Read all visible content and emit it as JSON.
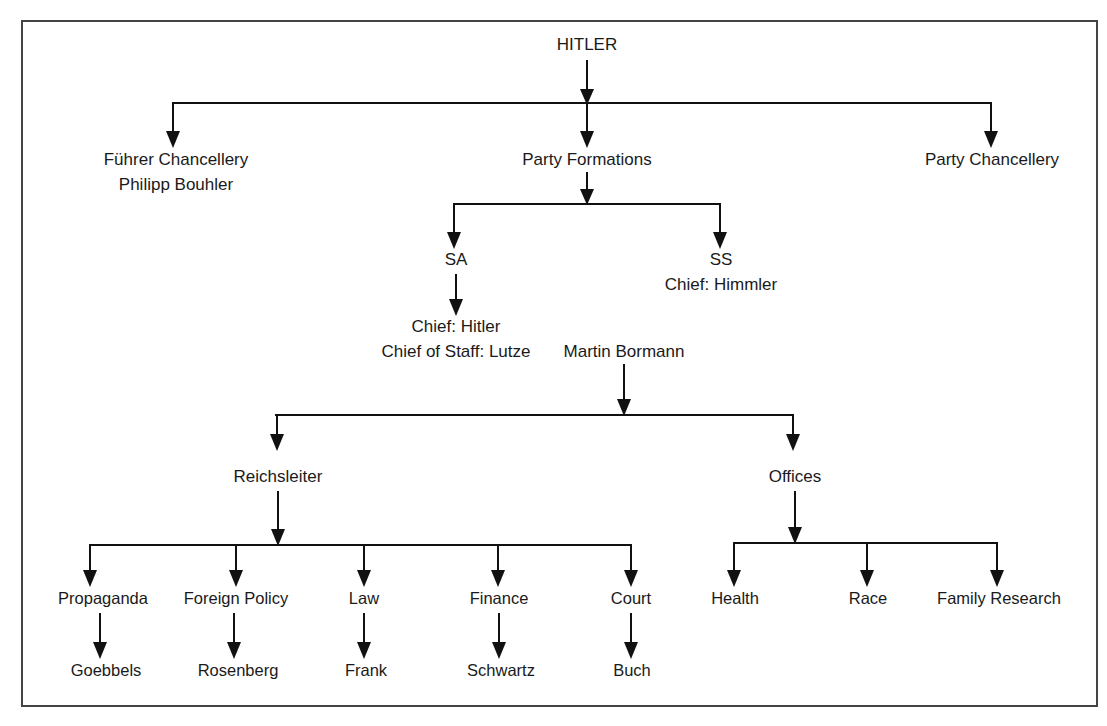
{
  "diagram": {
    "type": "org-chart",
    "frame": {
      "x": 21,
      "y": 20,
      "width": 1077,
      "height": 687,
      "color": "#444444"
    },
    "line_color": "#111111",
    "text_color": "#1a1a1a",
    "background": "#ffffff",
    "nodes": [
      {
        "id": "hitler",
        "label": "HITLER",
        "x": 587,
        "y": 50,
        "level": 0
      },
      {
        "id": "fuhrer-chancellery",
        "label": "Führer Chancellery",
        "x": 176,
        "y": 165,
        "level": 1
      },
      {
        "id": "philipp-bouhler",
        "label": "Philipp Bouhler",
        "x": 176,
        "y": 190,
        "level": 1
      },
      {
        "id": "party-formations",
        "label": "Party Formations",
        "x": 587,
        "y": 165,
        "level": 1
      },
      {
        "id": "party-chancellery",
        "label": "Party Chancellery",
        "x": 992,
        "y": 165,
        "level": 1
      },
      {
        "id": "sa",
        "label": "SA",
        "x": 456,
        "y": 265,
        "level": 2
      },
      {
        "id": "ss",
        "label": "SS",
        "x": 721,
        "y": 265,
        "level": 2
      },
      {
        "id": "ss-chief",
        "label": "Chief: Himmler",
        "x": 721,
        "y": 290,
        "level": 2
      },
      {
        "id": "sa-chief",
        "label": "Chief: Hitler",
        "x": 456,
        "y": 332,
        "level": 3
      },
      {
        "id": "sa-chief-of-staff",
        "label": "Chief of Staff: Lutze",
        "x": 456,
        "y": 357,
        "level": 3
      },
      {
        "id": "martin-bormann",
        "label": "Martin Bormann",
        "x": 624,
        "y": 357,
        "level": 3
      },
      {
        "id": "reichsleiter",
        "label": "Reichsleiter",
        "x": 278,
        "y": 482,
        "level": 4
      },
      {
        "id": "offices",
        "label": "Offices",
        "x": 795,
        "y": 482,
        "level": 4
      },
      {
        "id": "propaganda",
        "label": "Propaganda",
        "x": 103,
        "y": 604,
        "level": 5
      },
      {
        "id": "foreign-policy",
        "label": "Foreign Policy",
        "x": 236,
        "y": 604,
        "level": 5
      },
      {
        "id": "law",
        "label": "Law",
        "x": 364,
        "y": 604,
        "level": 5
      },
      {
        "id": "finance",
        "label": "Finance",
        "x": 499,
        "y": 604,
        "level": 5
      },
      {
        "id": "court",
        "label": "Court",
        "x": 631,
        "y": 604,
        "level": 5
      },
      {
        "id": "health",
        "label": "Health",
        "x": 735,
        "y": 604,
        "level": 5
      },
      {
        "id": "race",
        "label": "Race",
        "x": 868,
        "y": 604,
        "level": 5
      },
      {
        "id": "family-research",
        "label": "Family Research",
        "x": 999,
        "y": 604,
        "level": 5
      },
      {
        "id": "goebbels",
        "label": "Goebbels",
        "x": 106,
        "y": 676,
        "level": 6
      },
      {
        "id": "rosenberg",
        "label": "Rosenberg",
        "x": 238,
        "y": 676,
        "level": 6
      },
      {
        "id": "frank",
        "label": "Frank",
        "x": 366,
        "y": 676,
        "level": 6
      },
      {
        "id": "schwartz",
        "label": "Schwartz",
        "x": 501,
        "y": 676,
        "level": 6
      },
      {
        "id": "buch",
        "label": "Buch",
        "x": 632,
        "y": 676,
        "level": 6
      }
    ],
    "edges": [
      {
        "id": "hitler-to-bus1",
        "from": "hitler",
        "to": "level1-bus"
      },
      {
        "id": "bus1-to-fuhrer-chancellery",
        "from": "level1-bus",
        "to": "fuhrer-chancellery"
      },
      {
        "id": "bus1-to-party-formations",
        "from": "level1-bus",
        "to": "party-formations"
      },
      {
        "id": "bus1-to-party-chancellery",
        "from": "level1-bus",
        "to": "party-chancellery"
      },
      {
        "id": "party-formations-to-bus2",
        "from": "party-formations",
        "to": "level2-bus"
      },
      {
        "id": "bus2-to-sa",
        "from": "level2-bus",
        "to": "sa"
      },
      {
        "id": "bus2-to-ss",
        "from": "level2-bus",
        "to": "ss"
      },
      {
        "id": "sa-to-sa-chief",
        "from": "sa",
        "to": "sa-chief"
      },
      {
        "id": "bormann-to-bus3",
        "from": "martin-bormann",
        "to": "level4-bus"
      },
      {
        "id": "bus3-to-reichsleiter",
        "from": "level4-bus",
        "to": "reichsleiter"
      },
      {
        "id": "bus3-to-offices",
        "from": "level4-bus",
        "to": "offices"
      },
      {
        "id": "reichsleiter-to-bus4",
        "from": "reichsleiter",
        "to": "reichsleiter-bus"
      },
      {
        "id": "bus4-to-propaganda",
        "from": "reichsleiter-bus",
        "to": "propaganda"
      },
      {
        "id": "bus4-to-foreign-policy",
        "from": "reichsleiter-bus",
        "to": "foreign-policy"
      },
      {
        "id": "bus4-to-law",
        "from": "reichsleiter-bus",
        "to": "law"
      },
      {
        "id": "bus4-to-finance",
        "from": "reichsleiter-bus",
        "to": "finance"
      },
      {
        "id": "bus4-to-court",
        "from": "reichsleiter-bus",
        "to": "court"
      },
      {
        "id": "offices-to-bus5",
        "from": "offices",
        "to": "offices-bus"
      },
      {
        "id": "bus5-to-health",
        "from": "offices-bus",
        "to": "health"
      },
      {
        "id": "bus5-to-race",
        "from": "offices-bus",
        "to": "race"
      },
      {
        "id": "bus5-to-family-research",
        "from": "offices-bus",
        "to": "family-research"
      },
      {
        "id": "propaganda-to-goebbels",
        "from": "propaganda",
        "to": "goebbels"
      },
      {
        "id": "foreign-policy-to-rosenberg",
        "from": "foreign-policy",
        "to": "rosenberg"
      },
      {
        "id": "law-to-frank",
        "from": "law",
        "to": "frank"
      },
      {
        "id": "finance-to-schwartz",
        "from": "finance",
        "to": "schwartz"
      },
      {
        "id": "court-to-buch",
        "from": "court",
        "to": "buch"
      }
    ]
  }
}
